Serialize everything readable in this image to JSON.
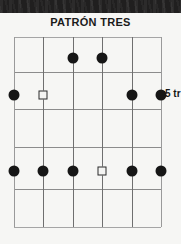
{
  "page": {
    "title": "PATRÓN TRES",
    "background_color": "#f6f6f4",
    "ink_color": "#161616"
  },
  "top_band": {
    "name": "scan-artifact-band",
    "color": "#201f1f"
  },
  "fret_label": {
    "text": "5 tr",
    "full_meaning_visible": "5 tr",
    "position": "right of 3rd fret line"
  },
  "diagram": {
    "type": "guitar-fretboard-pattern",
    "orientation": "vertical-frets-horizontal-strings-vertical",
    "string_count": 6,
    "fret_line_count": 6,
    "strings": [
      {
        "index": 1,
        "x": 0
      },
      {
        "index": 2,
        "x": 29.4
      },
      {
        "index": 3,
        "x": 58.8
      },
      {
        "index": 4,
        "x": 88.2
      },
      {
        "index": 5,
        "x": 117.6
      },
      {
        "index": 6,
        "x": 147
      }
    ],
    "frets": [
      {
        "index": 0,
        "y": 0
      },
      {
        "index": 1,
        "y": 35
      },
      {
        "index": 2,
        "y": 72
      },
      {
        "index": 3,
        "y": 110
      },
      {
        "index": 4,
        "y": 152
      },
      {
        "index": 5,
        "y": 190
      }
    ],
    "markers": [
      {
        "id": "m1",
        "shape": "dot",
        "string": 3,
        "x": 58.8,
        "y": 21,
        "row": "top"
      },
      {
        "id": "m2",
        "shape": "dot",
        "string": 4,
        "x": 88.2,
        "y": 21,
        "row": "top"
      },
      {
        "id": "m3",
        "shape": "dot",
        "string": 1,
        "x": 0,
        "y": 58,
        "row": "middle"
      },
      {
        "id": "m4",
        "shape": "square",
        "string": 2,
        "x": 29.4,
        "y": 58,
        "row": "middle"
      },
      {
        "id": "m5",
        "shape": "dot",
        "string": 5,
        "x": 117.6,
        "y": 58,
        "row": "middle"
      },
      {
        "id": "m6",
        "shape": "dot",
        "string": 6,
        "x": 147,
        "y": 58,
        "row": "middle"
      },
      {
        "id": "m7",
        "shape": "dot",
        "string": 1,
        "x": 0,
        "y": 134,
        "row": "lower"
      },
      {
        "id": "m8",
        "shape": "dot",
        "string": 2,
        "x": 29.4,
        "y": 134,
        "row": "lower"
      },
      {
        "id": "m9",
        "shape": "dot",
        "string": 3,
        "x": 58.8,
        "y": 134,
        "row": "lower"
      },
      {
        "id": "m10",
        "shape": "square",
        "string": 4,
        "x": 88.2,
        "y": 134,
        "row": "lower"
      },
      {
        "id": "m11",
        "shape": "dot",
        "string": 5,
        "x": 117.6,
        "y": 134,
        "row": "lower"
      },
      {
        "id": "m12",
        "shape": "dot",
        "string": 6,
        "x": 147,
        "y": 134,
        "row": "lower"
      }
    ],
    "legend": {
      "filled_dot": "scale tone",
      "open_square": "root note"
    }
  }
}
